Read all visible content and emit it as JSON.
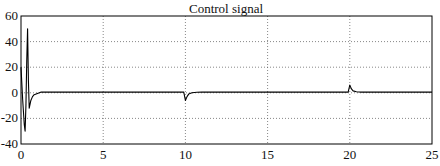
{
  "chart_data": {
    "type": "line",
    "title": "Control signal",
    "xlabel": "",
    "ylabel": "",
    "xlim": [
      0,
      25
    ],
    "ylim": [
      -40,
      60
    ],
    "grid": true,
    "legend": null,
    "x_ticks": [
      0,
      5,
      10,
      15,
      20,
      25
    ],
    "y_ticks": [
      -40,
      -20,
      0,
      20,
      40,
      60
    ],
    "x_tick_labels": [
      "0",
      "5",
      "10",
      "15",
      "20",
      "25"
    ],
    "y_tick_labels": [
      "-40",
      "-20",
      "0",
      "20",
      "40",
      "60"
    ],
    "series": [
      {
        "name": "Control signal",
        "color": "#000000",
        "x": [
          0,
          0.1,
          0.2,
          0.25,
          0.3,
          0.35,
          0.4,
          0.45,
          0.5,
          0.6,
          0.7,
          0.8,
          1.0,
          1.2,
          1.5,
          2,
          5,
          9.9,
          10.0,
          10.1,
          10.2,
          10.4,
          10.7,
          11,
          15,
          19.9,
          20.0,
          20.1,
          20.2,
          20.4,
          20.7,
          21,
          25
        ],
        "y": [
          20,
          -5,
          -25,
          -30,
          -10,
          25,
          50,
          10,
          -12,
          -6,
          -3,
          -1.5,
          -0.5,
          0.5,
          0.6,
          0.5,
          0.5,
          0.5,
          -6,
          -3,
          -1,
          0,
          0.4,
          0.5,
          0.5,
          0.5,
          6,
          3,
          1.5,
          0.8,
          0.5,
          0.5,
          0.5
        ]
      }
    ]
  }
}
